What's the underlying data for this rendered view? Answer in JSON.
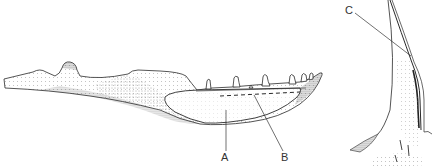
{
  "figure": {
    "colors": {
      "ink": "#2a2a2a",
      "stipple": "#555555",
      "background": "#ffffff"
    }
  },
  "labels": [
    {
      "id": "A",
      "text": "A",
      "x": 221,
      "y": 152
    },
    {
      "id": "B",
      "text": "B",
      "x": 281,
      "y": 152
    },
    {
      "id": "C",
      "text": "C",
      "x": 345,
      "y": 5
    }
  ]
}
